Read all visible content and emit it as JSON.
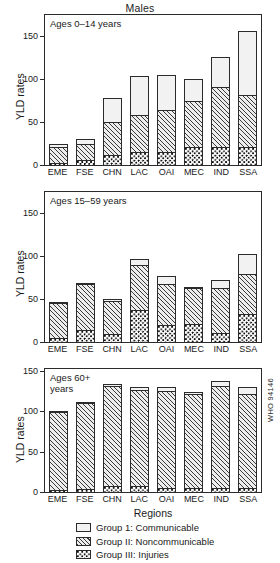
{
  "figure": {
    "title": "Males",
    "xlabel": "Regions",
    "ylabel": "YLD rates",
    "who_code": "WHO 94146"
  },
  "legend": {
    "items": [
      {
        "key": "g1",
        "label": "Group 1: Communicable"
      },
      {
        "key": "g2",
        "label": "Group II: Noncommunicable"
      },
      {
        "key": "g3",
        "label": "Group III: Injuries"
      }
    ]
  },
  "panels": [
    {
      "id": "panel1",
      "label": "Ages 0–14 years",
      "ytick_labels": [
        "150",
        "100",
        "50",
        "0"
      ]
    },
    {
      "id": "panel2",
      "label": "Ages 15–59 years",
      "ytick_labels": [
        "150",
        "100",
        "50",
        "0"
      ]
    },
    {
      "id": "panel3",
      "label": "Ages 60+\nyears",
      "ytick_labels": [
        "150",
        "100",
        "50",
        "0"
      ]
    }
  ],
  "chart_data": [
    {
      "type": "bar",
      "title": "Males",
      "subtitle": "Ages 0–14 years",
      "xlabel": "Regions",
      "ylabel": "YLD rates",
      "ylim": [
        0,
        175
      ],
      "yticks": [
        0,
        50,
        100,
        150
      ],
      "grid": false,
      "stacked": true,
      "legend_position": "bottom",
      "categories": [
        "EME",
        "FSE",
        "CHN",
        "LAC",
        "OAI",
        "MEC",
        "IND",
        "SSA"
      ],
      "series": [
        {
          "name": "Group III: Injuries",
          "values": [
            3,
            7,
            13,
            16,
            16,
            22,
            22,
            22
          ]
        },
        {
          "name": "Group II: Noncommunicable",
          "values": [
            20,
            20,
            39,
            45,
            50,
            55,
            71,
            62
          ]
        },
        {
          "name": "Group 1: Communicable",
          "values": [
            5,
            7,
            30,
            46,
            43,
            27,
            37,
            76
          ]
        }
      ],
      "totals": [
        28,
        34,
        82,
        107,
        109,
        104,
        130,
        160
      ]
    },
    {
      "type": "bar",
      "title": "Males",
      "subtitle": "Ages 15–59 years",
      "xlabel": "Regions",
      "ylabel": "YLD rates",
      "ylim": [
        0,
        175
      ],
      "yticks": [
        0,
        50,
        100,
        150
      ],
      "grid": false,
      "stacked": true,
      "legend_position": "bottom",
      "categories": [
        "EME",
        "FSE",
        "CHN",
        "LAC",
        "OAI",
        "MEC",
        "IND",
        "SSA"
      ],
      "series": [
        {
          "name": "Group III: Injuries",
          "values": [
            6,
            15,
            10,
            38,
            21,
            22,
            12,
            34
          ]
        },
        {
          "name": "Group II: Noncommunicable",
          "values": [
            42,
            55,
            40,
            54,
            49,
            43,
            53,
            48
          ]
        },
        {
          "name": "Group 1: Communicable",
          "values": [
            2,
            2,
            4,
            8,
            10,
            3,
            11,
            24
          ]
        }
      ],
      "totals": [
        50,
        72,
        54,
        100,
        80,
        68,
        76,
        106
      ]
    },
    {
      "type": "bar",
      "title": "Males",
      "subtitle": "Ages 60+ years",
      "xlabel": "Regions",
      "ylabel": "YLD rates",
      "ylim": [
        0,
        185
      ],
      "yticks": [
        0,
        50,
        100,
        150
      ],
      "grid": false,
      "stacked": true,
      "legend_position": "bottom",
      "categories": [
        "EME",
        "FSE",
        "CHN",
        "LAC",
        "OAI",
        "MEC",
        "IND",
        "SSA"
      ],
      "series": [
        {
          "name": "Group III: Injuries",
          "values": [
            5,
            6,
            10,
            10,
            8,
            8,
            7,
            7
          ]
        },
        {
          "name": "Group II: Noncommunicable",
          "values": [
            118,
            131,
            152,
            146,
            147,
            142,
            156,
            144
          ]
        },
        {
          "name": "Group 1: Communicable",
          "values": [
            3,
            3,
            5,
            6,
            7,
            5,
            9,
            12
          ]
        }
      ],
      "totals": [
        126,
        140,
        167,
        162,
        162,
        155,
        172,
        163
      ]
    }
  ]
}
